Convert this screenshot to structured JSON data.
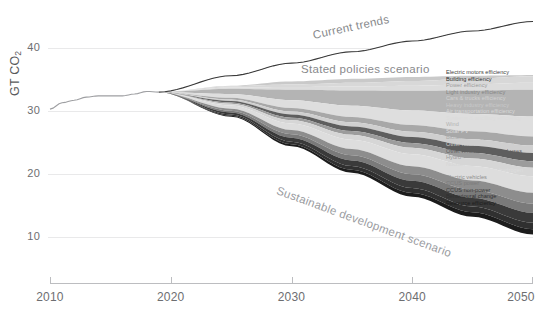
{
  "chart_data": {
    "type": "area",
    "title": "",
    "xlabel": "",
    "ylabel": "GT CO2",
    "ylabel_text": "GT CO",
    "ylabel_sub": "2",
    "xlim": [
      2010,
      2050
    ],
    "ylim": [
      6,
      45
    ],
    "grid": true,
    "xticks": [
      2010,
      2020,
      2030,
      2040,
      2050
    ],
    "yticks": [
      10,
      20,
      30,
      40
    ],
    "legend_position": "right",
    "annotations": [
      {
        "name": "current-trends",
        "text": "Current trends"
      },
      {
        "name": "stated-policies",
        "text": "Stated policies scenario"
      },
      {
        "name": "sustainable-development",
        "text": "Sustainable development scenario"
      }
    ],
    "historical": {
      "name": "Historical emissions",
      "x": [
        2010,
        2011,
        2012,
        2013,
        2014,
        2015,
        2016,
        2017,
        2018,
        2019
      ],
      "y": [
        30.3,
        31.3,
        31.7,
        32.2,
        32.4,
        32.4,
        32.4,
        32.7,
        33.1,
        33.0
      ]
    },
    "upper_bound": {
      "name": "Current trends",
      "x": [
        2019,
        2025,
        2030,
        2035,
        2040,
        2045,
        2050
      ],
      "y": [
        33.0,
        35.6,
        37.6,
        39.4,
        41.1,
        42.7,
        44.2
      ]
    },
    "stated_policies_line": {
      "name": "Stated policies scenario",
      "x": [
        2019,
        2025,
        2030,
        2035,
        2040,
        2045,
        2050
      ],
      "y": [
        33.0,
        34.0,
        34.7,
        35.1,
        35.4,
        35.6,
        35.7
      ]
    },
    "lower_bound": {
      "name": "Sustainable development scenario",
      "x": [
        2019,
        2025,
        2030,
        2035,
        2040,
        2045,
        2050
      ],
      "y": [
        33.0,
        29.1,
        24.4,
        20.2,
        16.4,
        13.2,
        10.4
      ]
    },
    "series": [
      {
        "name": "Electric motors efficiency",
        "color": "#101010",
        "values_2050": 0.55
      },
      {
        "name": "Building efficiency",
        "color": "#2e2e2e",
        "values_2050": 1.6
      },
      {
        "name": "Power efficiency",
        "color": "#4f4f4f",
        "values_2050": 0.7
      },
      {
        "name": "Light industry efficiency",
        "color": "#6e6e6e",
        "values_2050": 1.05
      },
      {
        "name": "Cars & trucks efficiency",
        "color": "#8f8f8f",
        "values_2050": 1.2
      },
      {
        "name": "Heavy industry efficiency",
        "color": "#ababab",
        "values_2050": 1.2
      },
      {
        "name": "Air transportation efficiency",
        "color": "#c4c4c4",
        "values_2050": 0.75
      },
      {
        "name": "Systems & ancillary efficiency",
        "color": "#d8d8d8",
        "values_2050": 0.8
      },
      {
        "name": "Solar",
        "color": "#ededed",
        "values_2050": 3.1
      },
      {
        "name": "Wind",
        "color": "#9b9b9b",
        "values_2050": 2.3
      },
      {
        "name": "Biofuels transport",
        "color": "#7b7b7b",
        "values_2050": 1.05
      },
      {
        "name": "Other renewables in power",
        "color": "#bdbdbd",
        "values_2050": 0.85
      },
      {
        "name": "Other renewables in end-uses",
        "color": "#616161",
        "values_2050": 0.95
      },
      {
        "name": "Hydro",
        "color": "#a6a6a6",
        "values_2050": 0.75
      },
      {
        "name": "Nuclear",
        "color": "#d2d2d2",
        "values_2050": 1.0
      },
      {
        "name": "Other fuel switching, hydrogen",
        "color": "#efefef",
        "values_2050": 1.9
      },
      {
        "name": "Electric vehicles",
        "color": "#8a8a8a",
        "values_2050": 1.25
      },
      {
        "name": "CCUS power",
        "color": "#5a5a5a",
        "values_2050": 1.05
      },
      {
        "name": "CCUS non-power",
        "color": "#3a3a3a",
        "values_2050": 1.15
      },
      {
        "name": "Behavioural change",
        "color": "#242424",
        "values_2050": 0.75
      },
      {
        "name": "Resource efficiency",
        "color": "#0d0d0d",
        "values_2050": 0.6
      }
    ]
  },
  "legend": {
    "items": [
      {
        "label": "Electric motors efficiency",
        "color": "#3d3d3d"
      },
      {
        "label": "Building efficiency",
        "color": "#2b2b2b"
      },
      {
        "label": "Power efficiency",
        "color": "#9a9a9a"
      },
      {
        "label": "Light industry efficiency",
        "color": "#848484"
      },
      {
        "label": "Cars & trucks efficiency",
        "color": "#d2d2d2"
      },
      {
        "label": "Heavy industry efficiency",
        "color": "#c9c9c9"
      },
      {
        "label": "Air transportation efficiency",
        "color": "#d8d8d8"
      },
      {
        "label": "Systems & ancillary efficiency",
        "color": "#dcdcdc"
      },
      {
        "label": "Wind",
        "color": "#b4b4b4"
      },
      {
        "label": "Solar PV",
        "color": "#dedede"
      },
      {
        "label": "Biofuels transport",
        "color": "#a8a8a8"
      },
      {
        "label": "Other renewables in power",
        "color": "#cfcfcf"
      },
      {
        "label": "Other renewables in end-uses",
        "color": "#5e5e5e"
      },
      {
        "label": "Hydro",
        "color": "#9c9c9c"
      },
      {
        "label": "Nuclear",
        "color": "#d6d6d6"
      },
      {
        "label": "Other fuel switching, hydrogen",
        "color": "#dddddd"
      },
      {
        "label": "Electric vehicles",
        "color": "#8d8d8d"
      },
      {
        "label": "CCUS power",
        "color": "#7a7a7a"
      },
      {
        "label": "CCUS non-power",
        "color": "#3a3a3a"
      },
      {
        "label": "Behavioural change",
        "color": "#303030"
      },
      {
        "label": "Resource efficiency",
        "color": "#1c1c1c"
      }
    ]
  },
  "colors": {
    "grid": "#e9e9ea",
    "axis": "#bcbdc0",
    "tick_text": "#6d6e71",
    "annotation": "#8e9093",
    "background": "#ffffff"
  }
}
